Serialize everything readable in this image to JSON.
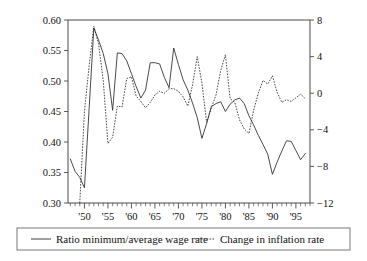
{
  "chart_data": {
    "type": "line",
    "title": "",
    "subtitle": "",
    "xlabel": "",
    "ylabel": "",
    "y2label": "",
    "grid": false,
    "legend_position": "bottom",
    "xlim": [
      1946.5,
      1998.0
    ],
    "ylim": [
      0.3,
      0.6
    ],
    "y2lim": [
      -12,
      8
    ],
    "x_ticks_major": [
      1950,
      1955,
      1960,
      1965,
      1970,
      1975,
      1980,
      1985,
      1990,
      1995
    ],
    "x_tick_labels": [
      "'50",
      "'55",
      "'60",
      "'65",
      "'70",
      "'75",
      "'80",
      "'85",
      "'90",
      "'95"
    ],
    "x_minor_tick_interval": 1,
    "y_ticks": [
      0.3,
      0.35,
      0.4,
      0.45,
      0.5,
      0.55,
      0.6
    ],
    "y_tick_labels": [
      "0.30",
      "0.35",
      "0.40",
      "0.45",
      "0.50",
      "0.55",
      "0.60"
    ],
    "y2_ticks": [
      -12,
      -8,
      -4,
      0,
      4,
      8
    ],
    "y2_tick_labels": [
      "-12",
      "-8",
      "-4",
      "0",
      "4",
      "8"
    ],
    "series": [
      {
        "name": "Ratio minimum/average wage rate",
        "axis": "left",
        "style": "solid",
        "color": "#2b2b2b",
        "x": [
          1947,
          1948,
          1949,
          1950,
          1951,
          1952,
          1953,
          1954,
          1955,
          1956,
          1957,
          1958,
          1959,
          1960,
          1961,
          1962,
          1963,
          1964,
          1965,
          1966,
          1967,
          1968,
          1969,
          1970,
          1971,
          1972,
          1973,
          1974,
          1975,
          1976,
          1977,
          1978,
          1979,
          1980,
          1981,
          1982,
          1983,
          1984,
          1985,
          1986,
          1987,
          1988,
          1989,
          1990,
          1991,
          1992,
          1993,
          1994,
          1995,
          1996,
          1997
        ],
        "values": [
          0.372,
          0.352,
          0.342,
          0.325,
          0.455,
          0.587,
          0.567,
          0.545,
          0.512,
          0.452,
          0.546,
          0.545,
          0.533,
          0.512,
          0.491,
          0.472,
          0.485,
          0.53,
          0.53,
          0.528,
          0.506,
          0.489,
          0.554,
          0.527,
          0.502,
          0.485,
          0.464,
          0.44,
          0.406,
          0.43,
          0.458,
          0.463,
          0.466,
          0.45,
          0.462,
          0.469,
          0.472,
          0.463,
          0.443,
          0.428,
          0.411,
          0.396,
          0.38,
          0.347,
          0.367,
          0.385,
          0.402,
          0.401,
          0.386,
          0.371,
          0.381
        ]
      },
      {
        "name": "Change in inflation rate",
        "axis": "right",
        "style": "dotted",
        "color": "#2b2b2b",
        "x": [
          1949,
          1950,
          1951,
          1952,
          1953,
          1954,
          1955,
          1956,
          1957,
          1958,
          1959,
          1960,
          1961,
          1962,
          1963,
          1964,
          1965,
          1966,
          1967,
          1968,
          1969,
          1970,
          1971,
          1972,
          1973,
          1974,
          1975,
          1976,
          1977,
          1978,
          1979,
          1980,
          1981,
          1982,
          1983,
          1984,
          1985,
          1986,
          1987,
          1988,
          1989,
          1990,
          1991,
          1992,
          1993,
          1994,
          1995,
          1996,
          1997
        ],
        "values": [
          -12.0,
          -2.0,
          3.0,
          7.3,
          5.4,
          1.4,
          -5.5,
          -4.8,
          -1.4,
          -1.5,
          1.6,
          1.8,
          -0.3,
          -0.9,
          -1.6,
          -1.0,
          -0.2,
          0.2,
          0.0,
          0.5,
          0.5,
          0.2,
          -0.4,
          -1.4,
          0.9,
          4.0,
          1.1,
          -3.2,
          -1.6,
          -0.2,
          2.5,
          4.2,
          -0.6,
          -1.0,
          -2.9,
          -3.9,
          -4.4,
          -1.9,
          0.0,
          1.4,
          1.0,
          1.9,
          0.1,
          -1.0,
          -0.7,
          -0.9,
          -0.5,
          -0.1,
          -0.6
        ]
      }
    ],
    "legend": [
      {
        "label": "Ratio minimum/average wage rate",
        "style": "solid"
      },
      {
        "label": "Change in inflation rate",
        "style": "dotted"
      }
    ]
  }
}
